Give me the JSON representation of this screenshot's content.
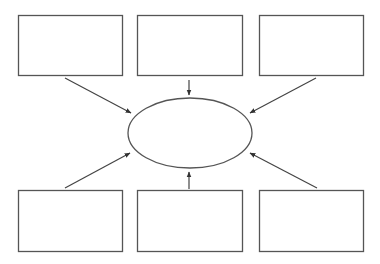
{
  "diagram": {
    "type": "hub-and-spoke",
    "stroke_color": "#555555",
    "fill_color": "#ffffff",
    "center": {
      "shape": "ellipse",
      "label": "",
      "cx": 190,
      "cy": 133,
      "rx": 62,
      "ry": 35
    },
    "boxes": [
      {
        "id": "top-left",
        "label": "",
        "x": 18,
        "y": 15,
        "w": 104,
        "h": 60
      },
      {
        "id": "top-middle",
        "label": "",
        "x": 137,
        "y": 15,
        "w": 105,
        "h": 60
      },
      {
        "id": "top-right",
        "label": "",
        "x": 259,
        "y": 15,
        "w": 104,
        "h": 60
      },
      {
        "id": "bottom-left",
        "label": "",
        "x": 18,
        "y": 190,
        "w": 104,
        "h": 61
      },
      {
        "id": "bottom-middle",
        "label": "",
        "x": 137,
        "y": 190,
        "w": 105,
        "h": 61
      },
      {
        "id": "bottom-right",
        "label": "",
        "x": 259,
        "y": 190,
        "w": 104,
        "h": 61
      }
    ],
    "arrows": [
      {
        "from": "top-left",
        "to": "center",
        "x1": 65,
        "y1": 78,
        "x2": 131,
        "y2": 113
      },
      {
        "from": "top-middle",
        "to": "center",
        "x1": 189,
        "y1": 80,
        "x2": 189,
        "y2": 95
      },
      {
        "from": "top-right",
        "to": "center",
        "x1": 316,
        "y1": 78,
        "x2": 250,
        "y2": 113
      },
      {
        "from": "bottom-left",
        "to": "center",
        "x1": 65,
        "y1": 188,
        "x2": 130,
        "y2": 153
      },
      {
        "from": "bottom-middle",
        "to": "center",
        "x1": 189,
        "y1": 189,
        "x2": 189,
        "y2": 172
      },
      {
        "from": "bottom-right",
        "to": "center",
        "x1": 317,
        "y1": 188,
        "x2": 250,
        "y2": 153
      }
    ]
  }
}
